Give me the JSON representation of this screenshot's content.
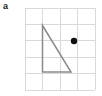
{
  "figure": {
    "part_label": "a",
    "width": 102,
    "height": 96,
    "background_color": "#ffffff"
  },
  "grid": {
    "name": "square-grid",
    "left": 25.0,
    "top": 8.0,
    "right": 95.0,
    "bottom": 90.0,
    "columns": 4,
    "rows": 5,
    "cell_width": 17.5,
    "cell_height": 16.4,
    "line_color": "#d9d9d9",
    "line_width": 1,
    "vertical_line_x": [
      25.0,
      42.5,
      60.0,
      77.5,
      95.0
    ],
    "horizontal_line_y": [
      8.0,
      24.4,
      40.8,
      57.2,
      73.6,
      90.0
    ]
  },
  "chart_data": {
    "type": "scatter",
    "title": "",
    "xlabel": "",
    "ylabel": "",
    "grid": true,
    "legend": "none",
    "xlim": [
      0,
      4
    ],
    "ylim": [
      0,
      5
    ],
    "shapes": [
      {
        "name": "right-triangle",
        "type": "polygon",
        "stroke": "#8a8a8a",
        "stroke_width": 1.5,
        "fill": "none",
        "vertices_px": [
          [
            42.5,
            25.5
          ],
          [
            42.5,
            72.0
          ],
          [
            71.0,
            72.0
          ]
        ],
        "vertices_grid": [
          [
            1,
            4
          ],
          [
            1,
            1
          ],
          [
            2.63,
            1
          ]
        ],
        "right_angle_at": "bottom-left"
      }
    ],
    "points": [
      {
        "name": "marked-point",
        "x_px": 74.0,
        "y_px": 41.0,
        "x_grid": 2.8,
        "y_grid": 3.0,
        "radius_px": 3.2,
        "color": "#111111",
        "marker": "filled-circle"
      }
    ]
  }
}
